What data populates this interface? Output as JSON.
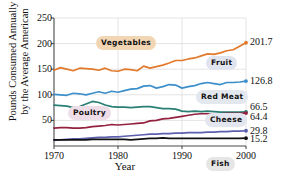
{
  "chart_data": {
    "type": "line",
    "title": "",
    "xlabel": "Year",
    "ylabel_line1": "Pounds Consumed Annually",
    "ylabel_line2": "by the Average American",
    "xlim": [
      1970,
      2000
    ],
    "ylim": [
      0,
      250
    ],
    "yticks": [
      50,
      100,
      150,
      200,
      250
    ],
    "xticks": [
      1970,
      1980,
      1990,
      2000
    ],
    "grid": true,
    "legend_position": "inline-callouts",
    "x": [
      1970,
      1971,
      1972,
      1973,
      1974,
      1975,
      1976,
      1977,
      1978,
      1979,
      1980,
      1981,
      1982,
      1983,
      1984,
      1985,
      1986,
      1987,
      1988,
      1989,
      1990,
      1991,
      1992,
      1993,
      1994,
      1995,
      1996,
      1997,
      1998,
      1999,
      2000
    ],
    "series": [
      {
        "name": "Vegetables",
        "color": "#E2792B",
        "end_value": "201.7",
        "values": [
          148,
          153,
          150,
          147,
          152,
          151,
          150,
          148,
          152,
          147,
          146,
          150,
          149,
          147,
          156,
          152,
          155,
          158,
          162,
          167,
          167,
          170,
          172,
          176,
          180,
          179,
          182,
          186,
          188,
          195,
          201.7
        ]
      },
      {
        "name": "Fruit",
        "color": "#3C8FCB",
        "end_value": "126.8",
        "values": [
          101,
          100,
          99,
          103,
          102,
          100,
          103,
          106,
          103,
          107,
          105,
          108,
          111,
          112,
          117,
          118,
          113,
          116,
          120,
          119,
          113,
          116,
          118,
          122,
          124,
          122,
          120,
          124,
          124,
          125,
          126.8
        ]
      },
      {
        "name": "Red Meat",
        "color": "#2A7F74",
        "end_value": "66.5",
        "values": [
          80,
          79,
          78,
          75,
          77,
          82,
          87,
          85,
          80,
          77,
          76,
          76,
          75,
          76,
          77,
          77,
          75,
          73,
          73,
          72,
          68,
          67,
          68,
          67,
          68,
          67,
          66,
          66,
          66,
          66,
          66.5
        ]
      },
      {
        "name": "Poultry",
        "color": "#93213F",
        "end_value": "64.4",
        "values": [
          35,
          36,
          36,
          35,
          35,
          36,
          38,
          39,
          40,
          42,
          41,
          42,
          43,
          44,
          45,
          49,
          50,
          53,
          54,
          56,
          58,
          60,
          62,
          63,
          63,
          63,
          63,
          64,
          64,
          64,
          64.4
        ]
      },
      {
        "name": "Cheese",
        "color": "#5B5FAE",
        "end_value": "29.8",
        "values": [
          11,
          12,
          13,
          14,
          14,
          15,
          16,
          17,
          17,
          18,
          18,
          19,
          20,
          21,
          22,
          23,
          23,
          24,
          24,
          25,
          25,
          26,
          26,
          26,
          27,
          27,
          28,
          28,
          29,
          29,
          29.8
        ]
      },
      {
        "name": "Fish",
        "color": "#111111",
        "end_value": "15.2",
        "values": [
          12,
          12,
          12,
          12,
          12,
          12,
          13,
          13,
          13,
          13,
          13,
          13,
          12,
          13,
          14,
          15,
          15,
          16,
          15,
          15,
          15,
          15,
          15,
          15,
          15,
          15,
          15,
          15,
          15,
          15,
          15.2
        ]
      }
    ],
    "callouts": [
      {
        "label": "Vegetables",
        "style": "c-veg",
        "left": 96,
        "top": 36
      },
      {
        "label": "Fruit",
        "style": "c-fruit",
        "left": 206,
        "top": 56
      },
      {
        "label": "Red Meat",
        "style": "c-redmeat",
        "left": 196,
        "top": 90
      },
      {
        "label": "Cheese",
        "style": "c-cheese",
        "left": 205,
        "top": 113
      },
      {
        "label": "Poultry",
        "style": "c-poultry",
        "left": 68,
        "top": 106
      },
      {
        "label": "Fish",
        "style": "c-fish",
        "left": 206,
        "top": 157
      }
    ]
  }
}
